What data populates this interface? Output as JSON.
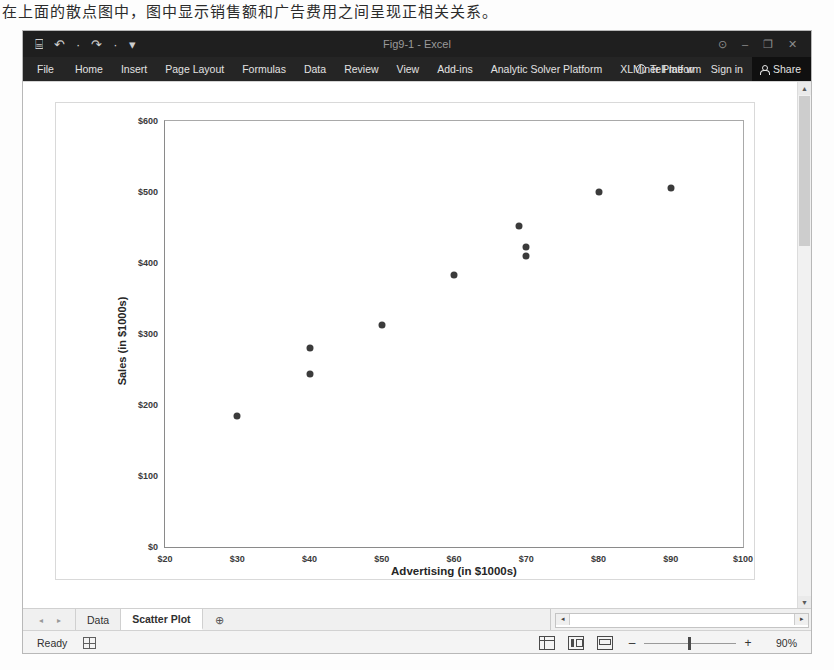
{
  "page": {
    "caption": "在上面的散点图中，图中显示销售额和广告费用之间呈现正相关关系。"
  },
  "titlebar": {
    "document_title": "Fig9-1 - Excel",
    "quick_access": [
      {
        "name": "save-button",
        "glyph": "⌸"
      },
      {
        "name": "undo-button",
        "glyph": "↶"
      },
      {
        "name": "undo-dropdown",
        "glyph": "·"
      },
      {
        "name": "redo-button",
        "glyph": "↷"
      },
      {
        "name": "redo-dropdown",
        "glyph": "·"
      },
      {
        "name": "customize-qat-button",
        "glyph": "▾"
      }
    ],
    "window_controls": [
      {
        "name": "ribbon-display-options",
        "glyph": "⊙"
      },
      {
        "name": "minimize-button",
        "glyph": "–"
      },
      {
        "name": "restore-button",
        "glyph": "❐"
      },
      {
        "name": "close-button",
        "glyph": "✕"
      }
    ]
  },
  "ribbon": {
    "tabs": [
      "File",
      "Home",
      "Insert",
      "Page Layout",
      "Formulas",
      "Data",
      "Review",
      "View",
      "Add-ins",
      "Analytic Solver Platform",
      "XLMiner Platform"
    ],
    "tell_me": "Tell me w",
    "sign_in": "Sign in",
    "share": "Share"
  },
  "chart_data": {
    "type": "scatter",
    "title": "",
    "xlabel": "Advertising (in $1000s)",
    "ylabel": "Sales (in $1000s)",
    "xlim": [
      20,
      100
    ],
    "ylim": [
      0,
      600
    ],
    "xticks": [
      20,
      30,
      40,
      50,
      60,
      70,
      80,
      90,
      100
    ],
    "xticklabels": [
      "$20",
      "$30",
      "$40",
      "$50",
      "$60",
      "$70",
      "$80",
      "$90",
      "$100"
    ],
    "yticks": [
      0,
      100,
      200,
      300,
      400,
      500,
      600
    ],
    "yticklabels": [
      "$0",
      "$100",
      "$200",
      "$300",
      "$400",
      "$500",
      "$600"
    ],
    "grid": false,
    "legend": false,
    "marker_color": "#3b3b3b",
    "points": [
      {
        "x": 30,
        "y": 185
      },
      {
        "x": 40,
        "y": 280
      },
      {
        "x": 40,
        "y": 243
      },
      {
        "x": 50,
        "y": 313
      },
      {
        "x": 60,
        "y": 383
      },
      {
        "x": 69,
        "y": 452
      },
      {
        "x": 70,
        "y": 423
      },
      {
        "x": 70,
        "y": 410
      },
      {
        "x": 80,
        "y": 500
      },
      {
        "x": 90,
        "y": 505
      }
    ]
  },
  "sheet_tabs": {
    "nav_first": "◂",
    "nav_prev": "▸",
    "tabs": [
      {
        "label": "Data",
        "active": false
      },
      {
        "label": "Scatter Plot",
        "active": true
      }
    ],
    "new_sheet": "⊕",
    "scroll_left": "◂",
    "scroll_right": "▸"
  },
  "statusbar": {
    "status": "Ready",
    "macro_record_icon": "record-macro-icon",
    "views": [
      "normal-view-button",
      "page-layout-view-button",
      "page-break-preview-button"
    ],
    "zoom_out": "–",
    "zoom_in": "+",
    "zoom_level": "90%"
  }
}
